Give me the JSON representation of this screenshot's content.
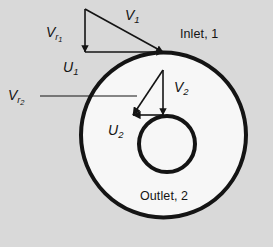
{
  "figure": {
    "background_color": "#d9d9d9",
    "line_color": "#141414",
    "fill_color": "#f7f7f7",
    "labels": {
      "v1": {
        "symbol": "V",
        "sub": "1",
        "text": "V1"
      },
      "vr1": {
        "symbol": "V",
        "sub": "r",
        "subsub": "1",
        "text": "Vr1"
      },
      "u1": {
        "symbol": "U",
        "sub": "1",
        "text": "U1"
      },
      "v2": {
        "symbol": "V",
        "sub": "2",
        "text": "V2"
      },
      "vr2": {
        "symbol": "V",
        "sub": "r",
        "subsub": "2",
        "text": "Vr2"
      },
      "u2": {
        "symbol": "U",
        "sub": "2",
        "text": "U2"
      },
      "inlet": "Inlet, 1",
      "outlet": "Outlet, 2"
    },
    "geometry": {
      "outer_circle": {
        "cx": 163.5,
        "cy": 135,
        "r": 82.5,
        "stroke_width": 4
      },
      "inner_circle": {
        "cx": 167,
        "cy": 144,
        "r": 28,
        "stroke_width": 4
      },
      "inlet_triangle": {
        "apex": [
          85,
          9
        ],
        "corner": [
          85,
          52
        ],
        "tip": [
          163,
          52
        ]
      },
      "outlet_triangle": {
        "apex": [
          163,
          70
        ],
        "corner": [
          163,
          115
        ],
        "tip": [
          133,
          115
        ]
      },
      "leader_line": {
        "from": [
          40,
          96
        ],
        "to": [
          137,
          96
        ]
      }
    }
  }
}
